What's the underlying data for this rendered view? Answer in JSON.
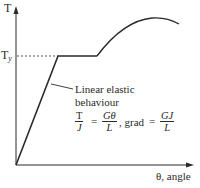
{
  "diagram": {
    "y_axis_label": "T",
    "yield_label_main": "T",
    "yield_label_sub": "y",
    "x_axis_label": "θ, angle",
    "annotation": {
      "line1": "Linear elastic",
      "line2": "behaviour",
      "eq1_num": "T",
      "eq1_den": "J",
      "eq_equals1": "=",
      "eq2_num": "Gθ",
      "eq2_den": "L",
      "eq_mid": ", grad",
      "eq_equals2": "=",
      "eq3_num": "GJ",
      "eq3_den": "L"
    },
    "colors": {
      "line": "#2a2a2a",
      "background": "#ffffff"
    }
  }
}
